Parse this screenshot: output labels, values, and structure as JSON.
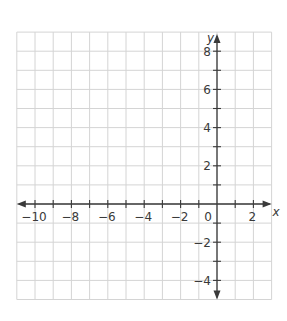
{
  "chart_data": {
    "type": "coordinate-grid",
    "title": "",
    "xlabel": "x",
    "ylabel": "y",
    "xlim": [
      -11,
      3
    ],
    "ylim": [
      -5,
      9
    ],
    "grid": true,
    "grid_step": 1,
    "x_ticks_labeled": [
      -10,
      -8,
      -6,
      -4,
      -2,
      2
    ],
    "y_ticks_labeled": [
      8,
      6,
      4,
      2,
      -2,
      -4
    ],
    "origin_label": "0",
    "x_tick_labels": [
      "−10",
      "−8",
      "−6",
      "−4",
      "−2",
      "2"
    ],
    "y_tick_labels": [
      "8",
      "6",
      "4",
      "2",
      "−2",
      "−4"
    ],
    "x_minor_ticks": [
      -10,
      -9,
      -8,
      -7,
      -6,
      -5,
      -4,
      -3,
      -2,
      -1,
      1,
      2
    ],
    "y_minor_ticks": [
      8,
      7,
      6,
      5,
      4,
      3,
      2,
      1,
      -1,
      -2,
      -3,
      -4
    ]
  },
  "colors": {
    "grid": "#d4d4d4",
    "axis": "#3a3a3a"
  }
}
